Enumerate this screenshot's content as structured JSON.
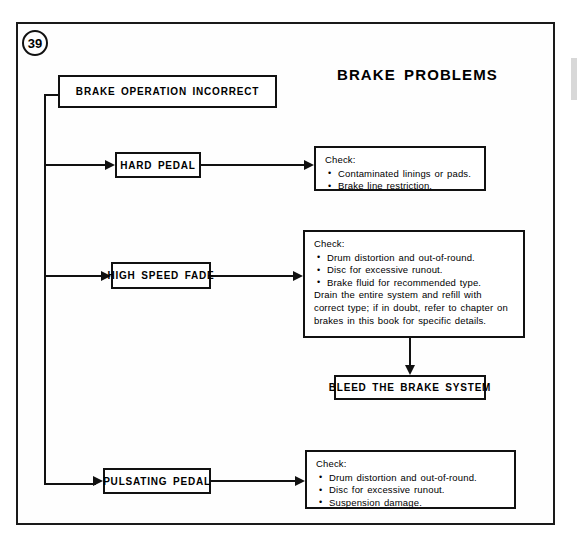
{
  "page": {
    "number": "39",
    "title": "BRAKE PROBLEMS"
  },
  "nodes": {
    "root": "BRAKE OPERATION INCORRECT",
    "hard_pedal": "HARD PEDAL",
    "high_speed_fade": "HIGH SPEED FADE",
    "pulsating_pedal": "PULSATING PEDAL",
    "bleed": "BLEED THE BRAKE SYSTEM"
  },
  "checks": {
    "hard_pedal": {
      "heading": "Check:",
      "items": [
        "Contaminated linings or pads.",
        "Brake line restriction."
      ],
      "note": ""
    },
    "high_speed_fade": {
      "heading": "Check:",
      "items": [
        "Drum distortion and out-of-round.",
        "Disc for excessive runout.",
        "Brake fluid for recommended type."
      ],
      "note": "Drain the entire system and refill with correct type; if in doubt, refer to chapter on brakes in this book for specific details."
    },
    "pulsating_pedal": {
      "heading": "Check:",
      "items": [
        "Drum distortion and out-of-round.",
        "Disc for excessive runout.",
        "Suspension damage."
      ],
      "note": ""
    }
  },
  "colors": {
    "ink": "#111111",
    "paper": "#ffffff"
  }
}
